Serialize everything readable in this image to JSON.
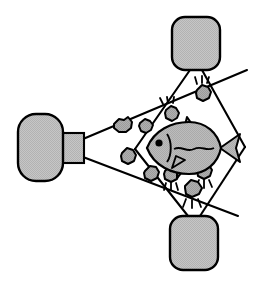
{
  "diagram": {
    "background_color": "#ffffff",
    "outline_color": "#000000",
    "fill_gray": "#bfbfbf",
    "fish_fill": "#b5b5b5",
    "particle_fill": "#a8a8a8",
    "stroke_width": 2.1
  },
  "devices": [
    {
      "id": "camera",
      "label": "camera",
      "body": {
        "x": 18,
        "y": 114,
        "width": 44,
        "height": 66,
        "radius": 18
      },
      "lens": {
        "x": 60,
        "y": 133,
        "width": 23,
        "height": 29
      }
    },
    {
      "id": "strobe-top",
      "label": "strobe-top",
      "body": {
        "x": 172,
        "y": 17,
        "width": 48,
        "height": 52,
        "radius": 13
      }
    },
    {
      "id": "strobe-bottom",
      "label": "strobe-bottom",
      "body": {
        "x": 170,
        "y": 216,
        "width": 48,
        "height": 54,
        "radius": 13
      }
    }
  ],
  "beams": {
    "camera_fov": {
      "apex": [
        83,
        138
      ],
      "upper_ray": [
        244,
        71
      ],
      "lower_ray": [
        235,
        214
      ],
      "apex_lower": [
        83,
        158
      ]
    },
    "strobe_top_cone": {
      "apex": [
        196,
        70
      ],
      "left_ray": [
        136,
        147
      ],
      "right_ray": [
        243,
        145
      ]
    },
    "strobe_bottom_cone": {
      "apex": [
        194,
        216
      ],
      "left_ray": [
        137,
        150
      ],
      "right_ray": [
        243,
        148
      ]
    },
    "overlap_region": {
      "left_vertex": [
        136,
        148
      ],
      "top_vertex": [
        196,
        70
      ],
      "right_vertex": [
        243,
        146
      ],
      "bottom_vertex": [
        194,
        216
      ]
    }
  },
  "fish": {
    "label": "fish",
    "center": [
      185,
      148
    ],
    "body_length": 78,
    "body_height": 34,
    "eye": [
      159,
      142
    ],
    "has_lateral_line": true,
    "has_gill_line": true,
    "fins": [
      "dorsal",
      "pectoral",
      "anal",
      "caudal"
    ]
  },
  "particles": {
    "unlit_label": "suspended-particle",
    "lit_label": "illuminated-particle",
    "unlit": [
      {
        "cx": 122,
        "cy": 128,
        "r": 9
      },
      {
        "cx": 146,
        "cy": 126,
        "r": 7
      },
      {
        "cx": 129,
        "cy": 158,
        "r": 8
      },
      {
        "cx": 152,
        "cy": 175,
        "r": 8
      }
    ],
    "lit": [
      {
        "cx": 172,
        "cy": 115,
        "r": 7,
        "rays": "up-left"
      },
      {
        "cx": 203,
        "cy": 95,
        "r": 8,
        "rays": "up"
      },
      {
        "cx": 171,
        "cy": 177,
        "r": 8,
        "rays": "down"
      },
      {
        "cx": 204,
        "cy": 174,
        "r": 8,
        "rays": "down"
      },
      {
        "cx": 192,
        "cy": 192,
        "r": 9,
        "rays": "down"
      }
    ]
  }
}
